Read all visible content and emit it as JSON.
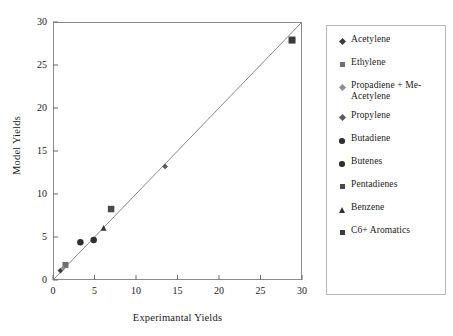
{
  "chart_data": {
    "type": "scatter",
    "title": "",
    "xlabel": "Experimantal Yields",
    "ylabel": "Model Yields",
    "xlim": [
      0,
      30
    ],
    "ylim": [
      0,
      30
    ],
    "xticks": [
      0,
      5,
      10,
      15,
      20,
      25,
      30
    ],
    "yticks": [
      0,
      5,
      10,
      15,
      20,
      25,
      30
    ],
    "grid": false,
    "legend_position": "right-outside",
    "reference_line": {
      "name": "parity-line",
      "from": [
        0,
        0
      ],
      "to": [
        30,
        30
      ]
    },
    "series": [
      {
        "name": "Acetylene",
        "marker": "diamond",
        "color": "#3d3d3d",
        "size": 5.0,
        "x": [
          0.9
        ],
        "y": [
          1.1
        ]
      },
      {
        "name": "Ethylene",
        "marker": "square",
        "color": "#6f6f6f",
        "size": 6.0,
        "x": [
          1.5
        ],
        "y": [
          1.75
        ]
      },
      {
        "name": "Propadiene + Me-Acetylene",
        "marker": "diamond",
        "color": "#8f8f8f",
        "size": 4.5,
        "x": [
          1.2
        ],
        "y": [
          1.35
        ]
      },
      {
        "name": "Propylene",
        "marker": "diamond",
        "color": "#5a5a5a",
        "size": 5.0,
        "x": [
          13.5
        ],
        "y": [
          13.2
        ]
      },
      {
        "name": "Butadiene",
        "marker": "circle",
        "color": "#2f2f2f",
        "size": 6.5,
        "x": [
          3.3
        ],
        "y": [
          4.4
        ]
      },
      {
        "name": "Butenes",
        "marker": "circle",
        "color": "#2f2f2f",
        "size": 6.5,
        "x": [
          4.9
        ],
        "y": [
          4.65
        ]
      },
      {
        "name": "Pentadienes",
        "marker": "square",
        "color": "#4a4a4a",
        "size": 6.5,
        "x": [
          7.0
        ],
        "y": [
          8.25
        ]
      },
      {
        "name": "Benzene",
        "marker": "triangle",
        "color": "#333333",
        "size": 6.0,
        "x": [
          6.1
        ],
        "y": [
          6.05
        ]
      },
      {
        "name": "C6+ Aromatics",
        "marker": "square",
        "color": "#3a3a3a",
        "size": 7.0,
        "x": [
          28.8
        ],
        "y": [
          27.9
        ]
      }
    ]
  },
  "legend": {
    "entries": [
      {
        "label": "Acetylene"
      },
      {
        "label": "Ethylene"
      },
      {
        "label": "Propadiene + Me-Acetylene"
      },
      {
        "label": "Propylene"
      },
      {
        "label": "Butadiene"
      },
      {
        "label": "Butenes"
      },
      {
        "label": "Pentadienes"
      },
      {
        "label": "Benzene"
      },
      {
        "label": "C6+ Aromatics"
      }
    ]
  },
  "colors": {
    "axis": "#8a8a8a",
    "tick": "#6a6a6a",
    "text": "#1a1a1a",
    "legend_border": "#b9b9b9",
    "reference_line": "#7a7a7a",
    "background": "#ffffff"
  }
}
